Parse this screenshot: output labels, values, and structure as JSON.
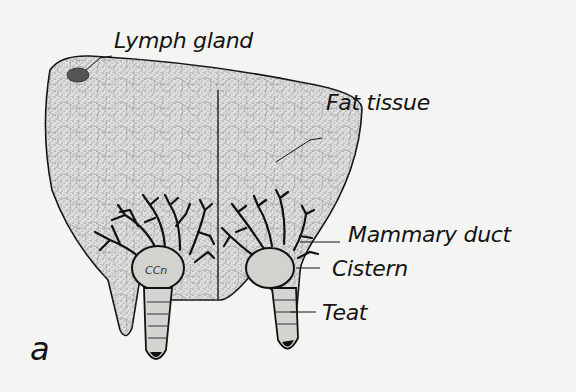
{
  "figure": {
    "panel_letter": "a",
    "colors": {
      "background": "#f4f4f2",
      "ink": "#141414",
      "tissue_fill": "#d9d9d6",
      "cell_lines": "#8a8a86",
      "duct": "#111111",
      "lymph": "#555555"
    },
    "labels": [
      {
        "id": "lymph-gland",
        "text": "Lymph gland"
      },
      {
        "id": "fat-tissue",
        "text": "Fat tissue"
      },
      {
        "id": "mammary-duct",
        "text": "Mammary duct"
      },
      {
        "id": "cistern",
        "text": "Cistern"
      },
      {
        "id": "teat",
        "text": "Teat"
      }
    ],
    "cistern_inner_text": "CCn"
  }
}
